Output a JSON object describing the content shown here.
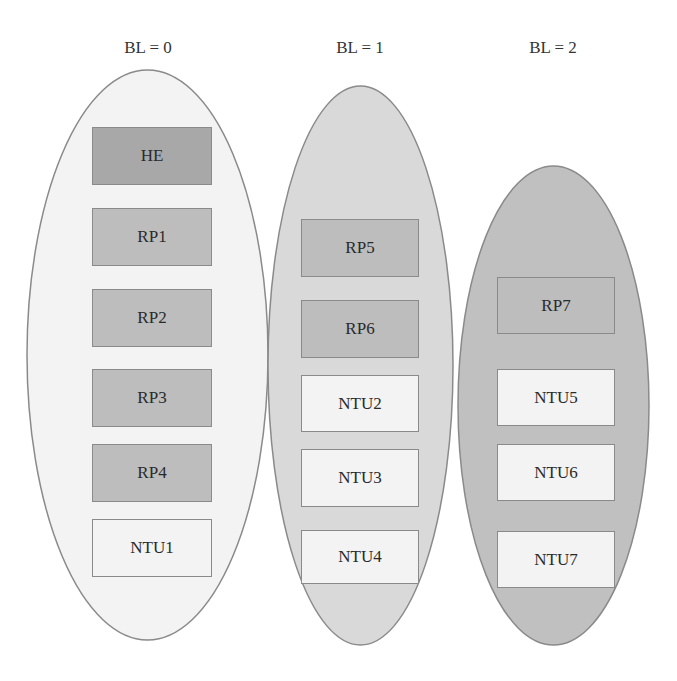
{
  "diagram": {
    "colors": {
      "stroke": "#8a8a8a",
      "ellipse_bl0": "#f3f3f3",
      "ellipse_bl1": "#d9d9d9",
      "ellipse_bl2": "#c0c0c0",
      "he_box": "#a8a8a8",
      "rp_box": "#bdbdbd",
      "ntu_box": "#f3f3f3"
    },
    "groups": [
      {
        "label": "BL = 0",
        "nodes": [
          {
            "label": "HE",
            "type": "he"
          },
          {
            "label": "RP1",
            "type": "rp"
          },
          {
            "label": "RP2",
            "type": "rp"
          },
          {
            "label": "RP3",
            "type": "rp"
          },
          {
            "label": "RP4",
            "type": "rp"
          },
          {
            "label": "NTU1",
            "type": "ntu"
          }
        ]
      },
      {
        "label": "BL = 1",
        "nodes": [
          {
            "label": "RP5",
            "type": "rp"
          },
          {
            "label": "RP6",
            "type": "rp"
          },
          {
            "label": "NTU2",
            "type": "ntu"
          },
          {
            "label": "NTU3",
            "type": "ntu"
          },
          {
            "label": "NTU4",
            "type": "ntu"
          }
        ]
      },
      {
        "label": "BL = 2",
        "nodes": [
          {
            "label": "RP7",
            "type": "rp"
          },
          {
            "label": "NTU5",
            "type": "ntu"
          },
          {
            "label": "NTU6",
            "type": "ntu"
          },
          {
            "label": "NTU7",
            "type": "ntu"
          }
        ]
      }
    ]
  }
}
